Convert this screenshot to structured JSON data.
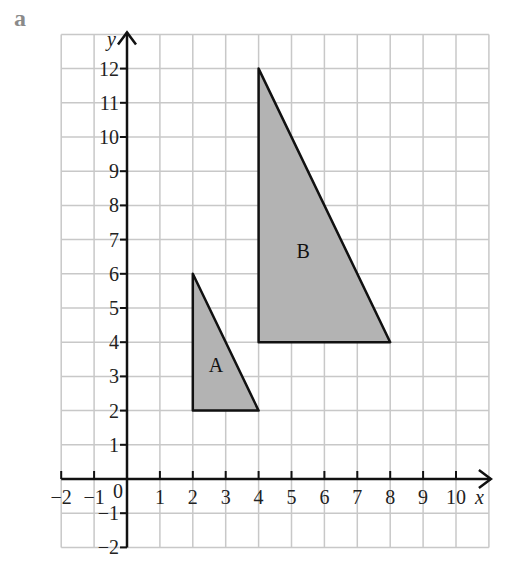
{
  "part_label": "a",
  "chart_data": {
    "type": "scatter",
    "title": "",
    "xlabel": "x",
    "ylabel": "y",
    "xlim": [
      -2,
      11
    ],
    "ylim": [
      -2,
      13
    ],
    "grid": true,
    "x_ticks": [
      -2,
      -1,
      1,
      2,
      3,
      4,
      5,
      6,
      7,
      8,
      9,
      10
    ],
    "y_ticks": [
      -2,
      -1,
      1,
      2,
      3,
      4,
      5,
      6,
      7,
      8,
      9,
      10,
      11,
      12
    ],
    "origin_label": "0",
    "shapes": [
      {
        "name": "A",
        "vertices": [
          [
            2,
            2
          ],
          [
            2,
            6
          ],
          [
            4,
            2
          ]
        ],
        "fill": "#b3b3b3"
      },
      {
        "name": "B",
        "vertices": [
          [
            4,
            4
          ],
          [
            4,
            12
          ],
          [
            8,
            4
          ]
        ],
        "fill": "#b3b3b3"
      }
    ]
  }
}
